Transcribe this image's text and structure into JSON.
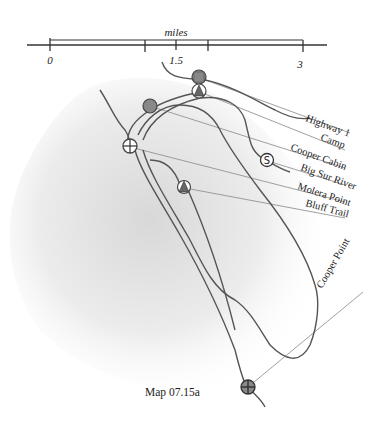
{
  "scale": {
    "unit_label": "miles",
    "ticks": [
      "0",
      "1.5",
      "3"
    ]
  },
  "legend_labels": [
    {
      "id": "highway",
      "label": "Highway 1"
    },
    {
      "id": "camp",
      "label": "Camp"
    },
    {
      "id": "cooper-cabin",
      "label": "Cooper Cabin"
    },
    {
      "id": "big-sur-river",
      "label": "Big Sur River"
    },
    {
      "id": "molera-point",
      "label": "Molera Point"
    },
    {
      "id": "bluff-trail",
      "label": "Bluff Trail"
    },
    {
      "id": "cooper-point",
      "label": "Cooper Point"
    }
  ],
  "caption": "Map 07.15a",
  "colors": {
    "ink": "#333333",
    "trail": "#555555",
    "marker_fill": "#888888",
    "leader": "#777777",
    "shade": "#dcdcdc"
  }
}
